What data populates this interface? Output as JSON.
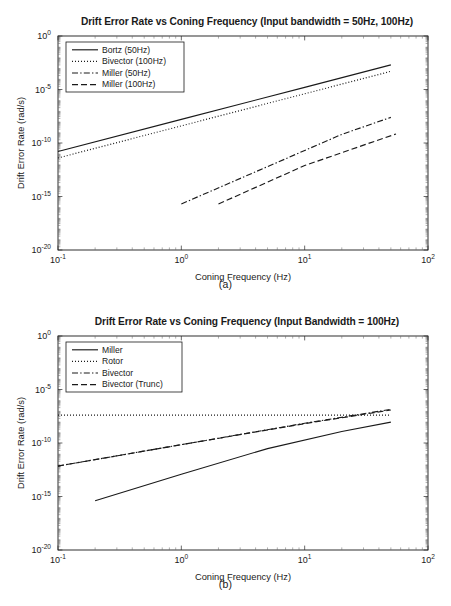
{
  "figure": {
    "panels": [
      {
        "caption": "(a)"
      },
      {
        "caption": "(b)"
      }
    ]
  },
  "chart_data": [
    {
      "type": "line",
      "panel": "a",
      "caption": "(a)",
      "title": "Drift Error Rate vs Coning Frequency (Input bandwidth = 50Hz, 100Hz)",
      "xlabel": "Coning Frequency (Hz)",
      "ylabel": "Drift Error Rate (rad/s)",
      "xscale": "log",
      "yscale": "log",
      "xlim": [
        0.1,
        100
      ],
      "ylim": [
        1e-20,
        1
      ],
      "xticks": [
        0.1,
        1,
        10,
        100
      ],
      "xticklabels": [
        "10-1",
        "100",
        "101",
        "102"
      ],
      "yticks": [
        1,
        1e-05,
        1e-10,
        1e-15,
        1e-20
      ],
      "yticklabels": [
        "100",
        "10-5",
        "10-10",
        "10-15",
        "10-20"
      ],
      "grid": false,
      "legend_position": "upper left",
      "series": [
        {
          "name": "Bortz (50Hz)",
          "style": "solid",
          "x": [
            0.1,
            1,
            10,
            50
          ],
          "y": [
            1.6e-11,
            1.6e-08,
            1.6e-05,
            0.002
          ]
        },
        {
          "name": "Bivector (100Hz)",
          "style": "dotted",
          "x": [
            0.1,
            1,
            10,
            50
          ],
          "y": [
            4e-12,
            4e-09,
            4e-06,
            0.0005
          ]
        },
        {
          "name": "Miller (50Hz)",
          "style": "dashdot",
          "x": [
            1,
            5,
            20,
            50
          ],
          "y": [
            2e-16,
            6.2e-13,
            6.4e-10,
            2.5e-08
          ]
        },
        {
          "name": "Miller (100Hz)",
          "style": "dashed",
          "x": [
            2,
            10,
            30,
            55
          ],
          "y": [
            2e-16,
            7.8e-13,
            6.3e-11,
            7e-10
          ]
        }
      ]
    },
    {
      "type": "line",
      "panel": "b",
      "caption": "(b)",
      "title": "Drift Error Rate vs Coning Frequency (Input Bandwidth = 100Hz)",
      "xlabel": "Coning Frequency (Hz)",
      "ylabel": "Drift Error Rate (rad/s)",
      "xscale": "log",
      "yscale": "log",
      "xlim": [
        0.1,
        100
      ],
      "ylim": [
        1e-20,
        1
      ],
      "xticks": [
        0.1,
        1,
        10,
        100
      ],
      "xticklabels": [
        "10-1",
        "100",
        "101",
        "102"
      ],
      "yticks": [
        1,
        1e-05,
        1e-10,
        1e-15,
        1e-20
      ],
      "yticklabels": [
        "100",
        "10-5",
        "10-10",
        "10-15",
        "10-20"
      ],
      "grid": false,
      "legend_position": "upper left",
      "series": [
        {
          "name": "Miller",
          "style": "solid",
          "x": [
            0.2,
            1,
            5,
            20,
            50
          ],
          "y": [
            4e-16,
            1.2e-13,
            3e-11,
            1.2e-09,
            9e-09
          ]
        },
        {
          "name": "Rotor",
          "style": "dotted",
          "x": [
            0.1,
            1,
            10,
            50
          ],
          "y": [
            4e-08,
            4e-08,
            4e-08,
            4e-08
          ]
        },
        {
          "name": "Bivector",
          "style": "dashdot",
          "x": [
            0.1,
            1,
            10,
            50
          ],
          "y": [
            7e-13,
            7e-11,
            7e-09,
            1.4e-07
          ]
        },
        {
          "name": "Bivector (Trunc)",
          "style": "dashed",
          "x": [
            0.1,
            1,
            10,
            50
          ],
          "y": [
            7e-13,
            7e-11,
            6.5e-09,
            1.2e-07
          ]
        }
      ]
    }
  ]
}
